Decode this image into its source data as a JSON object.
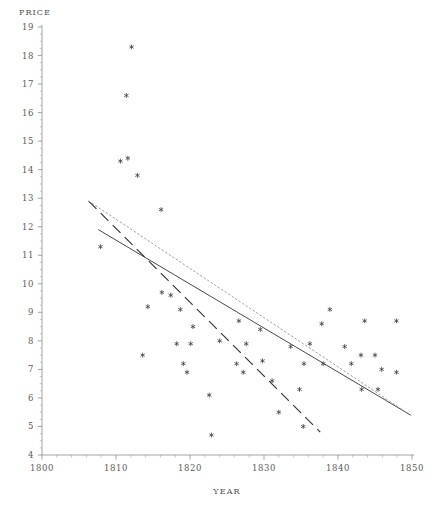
{
  "chart_data": {
    "type": "scatter",
    "title": "",
    "xlabel": "YEAR",
    "ylabel": "PRICE",
    "xlim": [
      1800,
      1850
    ],
    "ylim": [
      4,
      19
    ],
    "grid": false,
    "legend": "none",
    "x_ticks": [
      1800,
      1810,
      1820,
      1830,
      1840,
      1850
    ],
    "x_tick_labels": [
      "1800",
      "1810",
      "1820",
      "1830",
      "1840",
      "1850"
    ],
    "x_minor_tick_step": 2,
    "y_ticks": [
      4,
      5,
      6,
      7,
      8,
      9,
      10,
      11,
      12,
      13,
      14,
      15,
      16,
      17,
      18,
      19
    ],
    "y_tick_labels": [
      "4",
      "5",
      "6",
      "7",
      "8",
      "9",
      "10",
      "11",
      "12",
      "13",
      "14",
      "15",
      "16",
      "17",
      "18",
      "19"
    ],
    "y_minor_tick_step": 0.25,
    "marker_symbol": "asterisk",
    "marker_color": "#3a3a3a",
    "points": [
      {
        "x": 1812.1,
        "y": 18.3
      },
      {
        "x": 1811.4,
        "y": 16.6
      },
      {
        "x": 1810.6,
        "y": 14.3
      },
      {
        "x": 1811.6,
        "y": 14.4
      },
      {
        "x": 1812.9,
        "y": 13.8
      },
      {
        "x": 1816.1,
        "y": 12.6
      },
      {
        "x": 1807.9,
        "y": 11.3
      },
      {
        "x": 1816.2,
        "y": 9.7
      },
      {
        "x": 1817.4,
        "y": 9.6
      },
      {
        "x": 1814.3,
        "y": 9.2
      },
      {
        "x": 1818.7,
        "y": 9.1
      },
      {
        "x": 1820.4,
        "y": 8.5
      },
      {
        "x": 1826.6,
        "y": 8.7
      },
      {
        "x": 1829.5,
        "y": 8.4
      },
      {
        "x": 1838.9,
        "y": 9.1
      },
      {
        "x": 1837.8,
        "y": 8.6
      },
      {
        "x": 1843.6,
        "y": 8.7
      },
      {
        "x": 1847.9,
        "y": 8.7
      },
      {
        "x": 1818.2,
        "y": 7.9
      },
      {
        "x": 1820.1,
        "y": 7.9
      },
      {
        "x": 1824.0,
        "y": 8.0
      },
      {
        "x": 1827.6,
        "y": 7.9
      },
      {
        "x": 1833.6,
        "y": 7.8
      },
      {
        "x": 1836.2,
        "y": 7.9
      },
      {
        "x": 1840.9,
        "y": 7.8
      },
      {
        "x": 1843.1,
        "y": 7.5
      },
      {
        "x": 1845.0,
        "y": 7.5
      },
      {
        "x": 1813.6,
        "y": 7.5
      },
      {
        "x": 1819.1,
        "y": 7.2
      },
      {
        "x": 1826.3,
        "y": 7.2
      },
      {
        "x": 1829.8,
        "y": 7.3
      },
      {
        "x": 1835.4,
        "y": 7.2
      },
      {
        "x": 1838.0,
        "y": 7.2
      },
      {
        "x": 1841.8,
        "y": 7.2
      },
      {
        "x": 1845.9,
        "y": 7.0
      },
      {
        "x": 1847.9,
        "y": 6.9
      },
      {
        "x": 1819.6,
        "y": 6.9
      },
      {
        "x": 1827.2,
        "y": 6.9
      },
      {
        "x": 1831.1,
        "y": 6.6
      },
      {
        "x": 1834.8,
        "y": 6.3
      },
      {
        "x": 1843.2,
        "y": 6.3
      },
      {
        "x": 1845.4,
        "y": 6.3
      },
      {
        "x": 1822.6,
        "y": 6.1
      },
      {
        "x": 1832.0,
        "y": 5.5
      },
      {
        "x": 1835.3,
        "y": 5.0
      },
      {
        "x": 1822.9,
        "y": 4.7
      }
    ],
    "fit_lines": [
      {
        "name": "solid-regression",
        "style": "solid",
        "color": "#333333",
        "x_start": 1807.6,
        "y_start": 11.9,
        "x_end": 1849.8,
        "y_end": 5.4
      },
      {
        "name": "dashed-regression",
        "style": "dashed",
        "color": "#333333",
        "x_start": 1806.3,
        "y_start": 12.9,
        "x_end": 1837.6,
        "y_end": 4.8
      },
      {
        "name": "dotted-regression",
        "style": "dotted",
        "color": "#9a9a9a",
        "x_start": 1806.3,
        "y_start": 12.9,
        "x_end": 1849.8,
        "y_end": 5.4
      }
    ]
  },
  "labels": {
    "price": "PRICE",
    "year": "YEAR"
  }
}
